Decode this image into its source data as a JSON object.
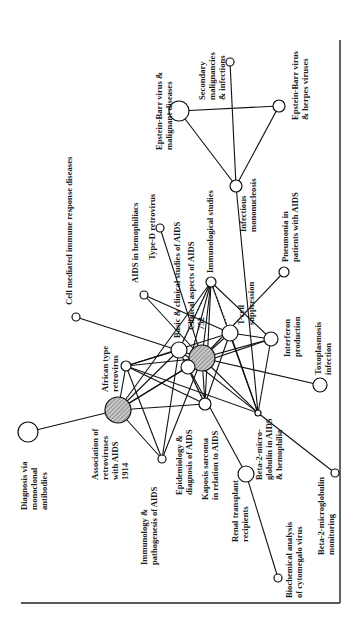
{
  "diagram": {
    "title": "",
    "orientation": "rotated-90-ccw",
    "nodes": [
      {
        "id": "ebv-malignant",
        "lines": [
          "Epstein-Barr virus &",
          "malignant diseases"
        ],
        "shaded": false
      },
      {
        "id": "secondary-malignancies",
        "lines": [
          "Secondary",
          "malignancies",
          "& infections"
        ],
        "shaded": false
      },
      {
        "id": "ebv-herpes",
        "lines": [
          "Epstein-Barr virus",
          "& herpes viruses"
        ],
        "shaded": false
      },
      {
        "id": "infectious-mononucleosis",
        "lines": [
          "Infectious",
          "mononucleosis"
        ],
        "shaded": false
      },
      {
        "id": "cell-mediated",
        "lines": [
          "Cell mediated immune response diseases"
        ],
        "shaded": false
      },
      {
        "id": "aids-hemophiliacs",
        "lines": [
          "AIDS in hemophiliacs"
        ],
        "shaded": false
      },
      {
        "id": "type-d-retrovirus",
        "lines": [
          "Type-D retrovirus"
        ],
        "shaded": false
      },
      {
        "id": "basic-clinical",
        "lines": [
          "Basic & clinical studies of AIDS"
        ],
        "shaded": false
      },
      {
        "id": "clinical-aspects",
        "lines": [
          "Clinical aspects of AIDS",
          "752"
        ],
        "shaded": true
      },
      {
        "id": "immunological-studies",
        "lines": [
          "Immunological studies"
        ],
        "shaded": false
      },
      {
        "id": "t-cell-suppression",
        "lines": [
          "T-cell",
          "suppression"
        ],
        "shaded": false
      },
      {
        "id": "pneumonia",
        "lines": [
          "Pneumonia in",
          "patients with AIDS"
        ],
        "shaded": false
      },
      {
        "id": "interferon",
        "lines": [
          "Interferon",
          "production"
        ],
        "shaded": false
      },
      {
        "id": "toxoplasmosis",
        "lines": [
          "Toxoplasmosis",
          "infection"
        ],
        "shaded": false
      },
      {
        "id": "african-retrovirus",
        "lines": [
          "African type",
          "retrovirus"
        ],
        "shaded": false
      },
      {
        "id": "association-retroviruses",
        "lines": [
          "Association of",
          "retroviruses",
          "with AIDS",
          "1914"
        ],
        "shaded": true
      },
      {
        "id": "diagnosis-monoclonal",
        "lines": [
          "Diagnosis via",
          "monoclonal",
          "antibodies"
        ],
        "shaded": false
      },
      {
        "id": "immunology-pathogenesis",
        "lines": [
          "Immunology &",
          "pathogenesis of AIDS"
        ],
        "shaded": false
      },
      {
        "id": "epidemiology",
        "lines": [
          "Epidemiology &",
          "diagnosis of AIDS"
        ],
        "shaded": false
      },
      {
        "id": "kaposi",
        "lines": [
          "Kaposis sarcoma",
          "in relation to AIDS"
        ],
        "shaded": false
      },
      {
        "id": "beta2-aids",
        "lines": [
          "Beta-2-micro-",
          "globulin in AIDS",
          "& hemophilia"
        ],
        "shaded": false
      },
      {
        "id": "renal-transplant",
        "lines": [
          "Renal transplant",
          "recipients"
        ],
        "shaded": false
      },
      {
        "id": "beta2-monitoring",
        "lines": [
          "Beta-2-microglobulin",
          "monitoring"
        ],
        "shaded": false
      },
      {
        "id": "biochemical-cmv",
        "lines": [
          "Biochemical analysis",
          "of cytomegalo virus"
        ],
        "shaded": false
      }
    ],
    "edges": [
      [
        "ebv-malignant",
        "ebv-herpes"
      ],
      [
        "ebv-malignant",
        "infectious-mononucleosis"
      ],
      [
        "ebv-herpes",
        "infectious-mononucleosis"
      ],
      [
        "secondary-malignancies",
        "infectious-mononucleosis"
      ],
      [
        "infectious-mononucleosis",
        "beta2-aids"
      ],
      [
        "cell-mediated",
        "clinical-aspects"
      ],
      [
        "aids-hemophiliacs",
        "t-cell-suppression"
      ],
      [
        "aids-hemophiliacs",
        "clinical-aspects"
      ],
      [
        "type-d-retrovirus",
        "clinical-aspects"
      ],
      [
        "immunological-studies",
        "clinical-aspects"
      ],
      [
        "immunological-studies",
        "basic-clinical"
      ],
      [
        "immunological-studies",
        "epidemiology"
      ],
      [
        "immunological-studies",
        "interferon"
      ],
      [
        "immunological-studies",
        "kaposi"
      ],
      [
        "immunological-studies",
        "beta2-aids"
      ],
      [
        "immunological-studies",
        "association-retroviruses"
      ],
      [
        "t-cell-suppression",
        "clinical-aspects"
      ],
      [
        "t-cell-suppression",
        "interferon"
      ],
      [
        "t-cell-suppression",
        "beta2-aids"
      ],
      [
        "t-cell-suppression",
        "african-retrovirus"
      ],
      [
        "t-cell-suppression",
        "kaposi"
      ],
      [
        "pneumonia",
        "clinical-aspects"
      ],
      [
        "interferon",
        "clinical-aspects"
      ],
      [
        "interferon",
        "beta2-aids"
      ],
      [
        "interferon",
        "epidemiology"
      ],
      [
        "toxoplasmosis",
        "clinical-aspects"
      ],
      [
        "african-retrovirus",
        "clinical-aspects"
      ],
      [
        "african-retrovirus",
        "basic-clinical"
      ],
      [
        "african-retrovirus",
        "association-retroviruses"
      ],
      [
        "african-retrovirus",
        "immunology-pathogenesis"
      ],
      [
        "african-retrovirus",
        "kaposi"
      ],
      [
        "african-retrovirus",
        "beta2-aids"
      ],
      [
        "association-retroviruses",
        "clinical-aspects"
      ],
      [
        "association-retroviruses",
        "basic-clinical"
      ],
      [
        "association-retroviruses",
        "diagnosis-monoclonal"
      ],
      [
        "association-retroviruses",
        "immunology-pathogenesis"
      ],
      [
        "association-retroviruses",
        "kaposi"
      ],
      [
        "association-retroviruses",
        "epidemiology"
      ],
      [
        "immunology-pathogenesis",
        "clinical-aspects"
      ],
      [
        "immunology-pathogenesis",
        "basic-clinical"
      ],
      [
        "kaposi",
        "clinical-aspects"
      ],
      [
        "kaposi",
        "basic-clinical"
      ],
      [
        "beta2-aids",
        "clinical-aspects"
      ],
      [
        "beta2-aids",
        "basic-clinical"
      ],
      [
        "beta2-aids",
        "beta2-monitoring"
      ],
      [
        "renal-transplant",
        "biochemical-cmv"
      ],
      [
        "renal-transplant",
        "epidemiology"
      ]
    ],
    "dotted_edges": [
      [
        "basic-clinical",
        "immunological-studies"
      ],
      [
        "epidemiology",
        "kaposi"
      ],
      [
        "t-cell-suppression",
        "immunological-studies"
      ]
    ]
  }
}
